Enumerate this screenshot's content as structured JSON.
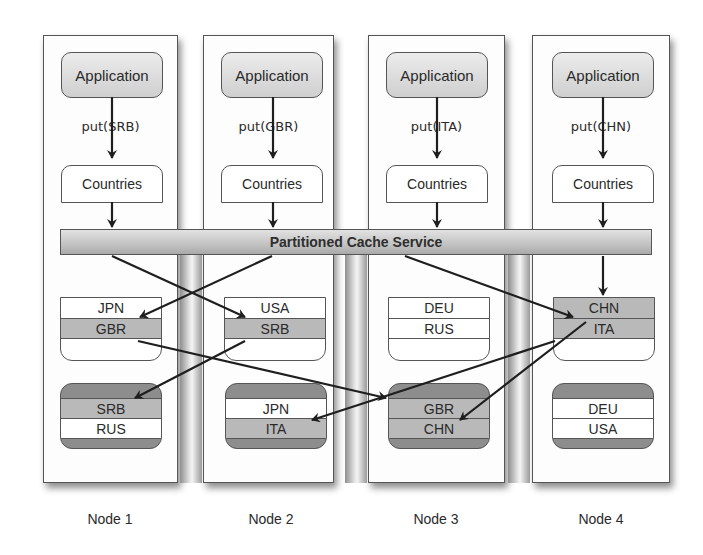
{
  "diagram": {
    "cache_service_label": "Partitioned Cache Service",
    "nodes": [
      {
        "label": "Node 1",
        "application": "Application",
        "put": "put(SRB)",
        "countries": "Countries",
        "primary": [
          {
            "value": "JPN",
            "shade": "white"
          },
          {
            "value": "GBR",
            "shade": "grey"
          }
        ],
        "backup": [
          {
            "value": "SRB",
            "shade": "grey"
          },
          {
            "value": "RUS",
            "shade": "white"
          }
        ]
      },
      {
        "label": "Node 2",
        "application": "Application",
        "put": "put(GBR)",
        "countries": "Countries",
        "primary": [
          {
            "value": "USA",
            "shade": "white"
          },
          {
            "value": "SRB",
            "shade": "grey"
          }
        ],
        "backup": [
          {
            "value": "JPN",
            "shade": "white"
          },
          {
            "value": "ITA",
            "shade": "grey"
          }
        ]
      },
      {
        "label": "Node 3",
        "application": "Application",
        "put": "put(ITA)",
        "countries": "Countries",
        "primary": [
          {
            "value": "DEU",
            "shade": "white"
          },
          {
            "value": "RUS",
            "shade": "white"
          }
        ],
        "backup": [
          {
            "value": "GBR",
            "shade": "grey"
          },
          {
            "value": "CHN",
            "shade": "grey"
          }
        ]
      },
      {
        "label": "Node 4",
        "application": "Application",
        "put": "put(CHN)",
        "countries": "Countries",
        "primary": [
          {
            "value": "CHN",
            "shade": "grey"
          },
          {
            "value": "ITA",
            "shade": "grey"
          }
        ],
        "backup": [
          {
            "value": "DEU",
            "shade": "white"
          },
          {
            "value": "USA",
            "shade": "white"
          }
        ]
      }
    ],
    "colors": {
      "highlight_row": "#b9b9b9",
      "backup_fill": "#8d8d8d",
      "border": "#555555"
    }
  }
}
